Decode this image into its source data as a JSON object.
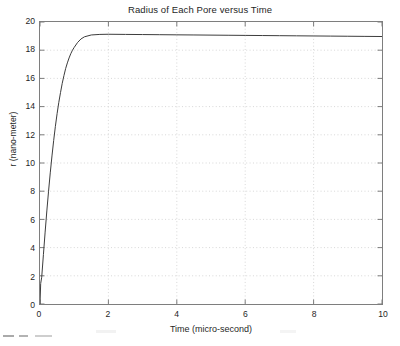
{
  "figure": {
    "title": "Radius of Each Pore versus Time",
    "background_color": "#ffffff",
    "axes_color": "#7e7e7e",
    "grid_color": "#cccccc",
    "curve_color": "#3a3a3a"
  },
  "axes": {
    "x_label": "Time  (micro-second)",
    "y_label": "r (nano-meter)",
    "x_ticks": [
      "0",
      "2",
      "4",
      "6",
      "8",
      "10"
    ],
    "y_ticks": [
      "0",
      "2",
      "4",
      "6",
      "8",
      "10",
      "12",
      "14",
      "16",
      "18",
      "20"
    ]
  },
  "chart_data": {
    "type": "line",
    "title": "Radius of Each Pore versus Time",
    "xlabel": "Time  (micro-second)",
    "ylabel": "r (nano-meter)",
    "xlim": [
      0,
      10
    ],
    "ylim": [
      0,
      20
    ],
    "xticks": [
      0,
      2,
      4,
      6,
      8,
      10
    ],
    "yticks": [
      0,
      2,
      4,
      6,
      8,
      10,
      12,
      14,
      16,
      18,
      20
    ],
    "grid": true,
    "legend": null,
    "series": [
      {
        "name": "r(t)",
        "color": "#3a3a3a",
        "linewidth": 1,
        "x": [
          0.0,
          0.02,
          0.05,
          0.1,
          0.15,
          0.2,
          0.25,
          0.3,
          0.35,
          0.4,
          0.45,
          0.5,
          0.55,
          0.6,
          0.65,
          0.7,
          0.75,
          0.8,
          0.85,
          0.9,
          0.95,
          1.0,
          1.1,
          1.2,
          1.3,
          1.5,
          1.75,
          2.0,
          2.5,
          3.0,
          3.5,
          4.0,
          4.5,
          5.0,
          5.5,
          6.0,
          6.5,
          7.0,
          7.5,
          8.0,
          8.5,
          9.0,
          9.5,
          10.0
        ],
        "y": [
          0.0,
          1.45,
          1.9,
          3.5,
          5.1,
          6.6,
          8.0,
          9.3,
          10.5,
          11.6,
          12.6,
          13.5,
          14.3,
          15.0,
          15.65,
          16.2,
          16.7,
          17.1,
          17.45,
          17.75,
          18.0,
          18.2,
          18.55,
          18.8,
          18.95,
          19.08,
          19.12,
          19.13,
          19.12,
          19.11,
          19.1,
          19.09,
          19.08,
          19.07,
          19.06,
          19.05,
          19.04,
          19.03,
          19.02,
          19.01,
          19.0,
          18.99,
          18.98,
          18.97
        ]
      }
    ],
    "annotations": [
      {
        "text": "initial radius at t=0 is near 1 nm",
        "x": 0,
        "y": 1.0
      },
      {
        "text": "saturates near 19.1 nm",
        "x": 2,
        "y": 19.1
      }
    ]
  }
}
